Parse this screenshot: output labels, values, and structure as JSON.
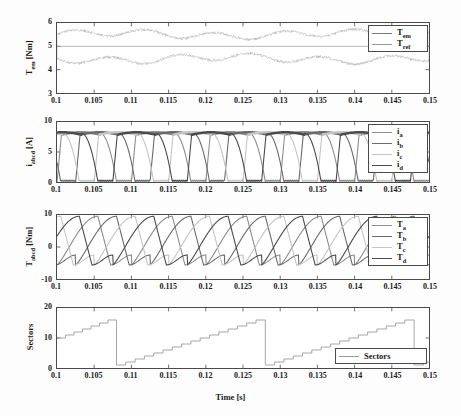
{
  "figure": {
    "background_color": "#fdfdfd",
    "axis_color": "#4a4a4a",
    "xlabel": "Time [s]",
    "xticks": [
      "0.1",
      "0.105",
      "0.11",
      "0.115",
      "0.12",
      "0.125",
      "0.13",
      "0.135",
      "0.14",
      "0.145",
      "0.15"
    ],
    "xlim": [
      0.1,
      0.15
    ]
  },
  "chart_data": [
    {
      "type": "line",
      "title": "",
      "xlabel": "",
      "ylabel": "T_em [Nm]",
      "ylabel_base": "T",
      "ylabel_sub": "em",
      "ylabel_unit": "[Nm]",
      "xlim": [
        0.1,
        0.15
      ],
      "ylim": [
        3,
        6
      ],
      "yticks": [
        "3",
        "4",
        "5",
        "6"
      ],
      "xticks": [
        "0.1",
        "0.105",
        "0.11",
        "0.115",
        "0.12",
        "0.125",
        "0.13",
        "0.135",
        "0.14",
        "0.145",
        "0.15"
      ],
      "grid": false,
      "legend_position": "upper-right",
      "series": [
        {
          "name": "T_em",
          "label_base": "T",
          "label_sub": "em",
          "color": "#777777",
          "description": "high-frequency hysteresis ripple oscillating about 5 Nm, band roughly 4.15 to 5.45 Nm",
          "mean": 5.0,
          "ripple_band": [
            4.15,
            5.45
          ]
        },
        {
          "name": "T_ref",
          "label_base": "T",
          "label_sub": "ref",
          "color": "#9a9a9a",
          "description": "constant reference at 5 Nm",
          "value": 5.0
        }
      ]
    },
    {
      "type": "line",
      "title": "",
      "xlabel": "",
      "ylabel": "i_abcd [A]",
      "ylabel_base": "i",
      "ylabel_sub": "abcd",
      "ylabel_unit": "[A]",
      "xlim": [
        0.1,
        0.15
      ],
      "ylim": [
        0,
        10
      ],
      "yticks": [
        "0",
        "5",
        "10"
      ],
      "xticks": [
        "0.1",
        "0.105",
        "0.11",
        "0.115",
        "0.12",
        "0.125",
        "0.13",
        "0.135",
        "0.14",
        "0.145",
        "0.15"
      ],
      "grid": false,
      "legend_position": "upper-right",
      "period": 0.01,
      "peak_current": 8.3,
      "series": [
        {
          "name": "i_a",
          "label_base": "i",
          "label_sub": "a",
          "color": "#8c8c8c",
          "phase_offset": 0.0,
          "description": "chopped phase current, rises to ~8.3 A plateau then falls to 0"
        },
        {
          "name": "i_b",
          "label_base": "i",
          "label_sub": "b",
          "color": "#6a6a6a",
          "phase_offset": 0.0025,
          "description": "chopped phase current shifted by quarter period"
        },
        {
          "name": "i_c",
          "label_base": "i",
          "label_sub": "c",
          "color": "#c4c4c4",
          "phase_offset": 0.005,
          "description": "chopped phase current shifted by half period"
        },
        {
          "name": "i_d",
          "label_base": "i",
          "label_sub": "d",
          "color": "#4a4a4a",
          "phase_offset": 0.0075,
          "description": "chopped phase current shifted by three-quarter period"
        }
      ]
    },
    {
      "type": "line",
      "title": "",
      "xlabel": "",
      "ylabel": "T_abcd [Nm]",
      "ylabel_base": "T",
      "ylabel_sub": "abcd",
      "ylabel_unit": "[Nm]",
      "xlim": [
        0.1,
        0.15
      ],
      "ylim": [
        -10,
        10
      ],
      "yticks": [
        "-10",
        "0",
        "10"
      ],
      "xticks": [
        "0.1",
        "0.105",
        "0.11",
        "0.115",
        "0.12",
        "0.125",
        "0.13",
        "0.135",
        "0.14",
        "0.145",
        "0.15"
      ],
      "grid": false,
      "legend_position": "upper-right",
      "period": 0.01,
      "peak_torque": 9.6,
      "min_torque": -5.6,
      "series": [
        {
          "name": "T_a",
          "label_base": "T",
          "label_sub": "a",
          "color": "#8c8c8c",
          "phase_offset": 0.0,
          "description": "per-phase torque contribution rising to ~9.6 Nm then dipping to ~-5.5 Nm"
        },
        {
          "name": "T_b",
          "label_base": "T",
          "label_sub": "b",
          "color": "#6a6a6a",
          "phase_offset": 0.0025,
          "description": "per-phase torque shifted by quarter period"
        },
        {
          "name": "T_c",
          "label_base": "T",
          "label_sub": "c",
          "color": "#c4c4c4",
          "phase_offset": 0.005,
          "description": "per-phase torque shifted by half period"
        },
        {
          "name": "T_d",
          "label_base": "T",
          "label_sub": "d",
          "color": "#4a4a4a",
          "phase_offset": 0.0075,
          "description": "per-phase torque shifted by three-quarter period"
        }
      ]
    },
    {
      "type": "line",
      "title": "",
      "xlabel": "Time [s]",
      "ylabel": "Sectors",
      "ylabel_base": "Sectors",
      "ylabel_sub": "",
      "ylabel_unit": "",
      "xlim": [
        0.1,
        0.15
      ],
      "ylim": [
        0,
        20
      ],
      "yticks": [
        "0",
        "10",
        "20"
      ],
      "xticks": [
        "0.1",
        "0.105",
        "0.11",
        "0.115",
        "0.12",
        "0.125",
        "0.13",
        "0.135",
        "0.14",
        "0.145",
        "0.15"
      ],
      "grid": false,
      "legend_position": "lower-right",
      "sector_min": 1,
      "sector_max": 16,
      "staircase_steps": 16,
      "reset_times": [
        0.108,
        0.128,
        0.148
      ],
      "start_sector": 10,
      "series": [
        {
          "name": "Sectors",
          "label_base": "Sectors",
          "label_sub": "",
          "color": "#9a9a9a",
          "description": "staircase counter ramping 1..16 then resetting; first ramp starts at 10 and resets at 0.108 s, then full ramps resetting at 0.128 s and 0.148 s"
        }
      ]
    }
  ]
}
